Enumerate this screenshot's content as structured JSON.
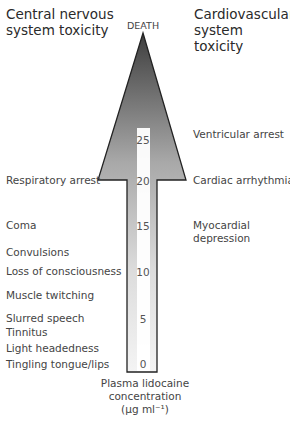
{
  "headers": {
    "left": [
      "Central nervous",
      "system toxicity"
    ],
    "right": [
      "Cardiovascular",
      "system toxicity"
    ]
  },
  "apex_label": "DEATH",
  "axis": {
    "label_lines": [
      "Plasma lidocaine",
      "concentration",
      "(µg ml⁻¹)"
    ],
    "ticks": [
      "25",
      "20",
      "15",
      "10",
      "5",
      "0"
    ]
  },
  "cns_effects": [
    "Respiratory arrest",
    "Coma",
    "Convulsions",
    "Loss of consciousness",
    "Muscle twitching",
    "Slurred speech",
    "Tinnitus",
    "Light headedness",
    "Tingling tongue/lips"
  ],
  "cv_effects": [
    "Ventricular arrest",
    "Cardiac arrhythmias",
    "Myocardial",
    "depression"
  ],
  "colors": {
    "arrow_top": "#4a4a4a",
    "arrow_bottom": "#f2f2f2",
    "outline": "#222222",
    "bar": "#ffffff"
  }
}
